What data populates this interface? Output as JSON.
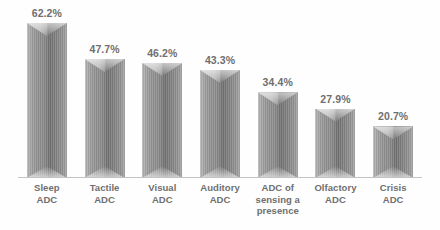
{
  "chart_data": {
    "type": "bar",
    "title": "",
    "subtitle": "",
    "xlabel": "",
    "ylabel": "",
    "grid": false,
    "legend": false,
    "ylim": [
      0,
      70
    ],
    "value_suffix": "%",
    "categories": [
      "Sleep\nADC",
      "Tactile\nADC",
      "Visual\nADC",
      "Auditory\nADC",
      "ADC of\nsensing a\npresence",
      "Olfactory\nADC",
      "Crisis\nADC"
    ],
    "values": [
      62.2,
      47.7,
      46.2,
      43.3,
      34.4,
      27.9,
      20.7
    ],
    "value_labels": [
      "62.2%",
      "47.7%",
      "46.2%",
      "43.3%",
      "34.4%",
      "27.9%",
      "20.7%"
    ],
    "colors": {
      "background": "#fefefe",
      "bar_light": "#b6b6b6",
      "bar_mid": "#8a8a8a",
      "bar_dark": "#6e6e6e",
      "text": "#6f6f6f",
      "axis": "#c3c3c3"
    }
  }
}
